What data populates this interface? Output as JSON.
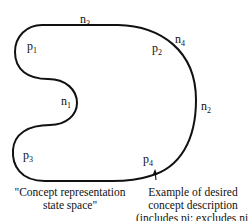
{
  "diagram": {
    "labels": {
      "p1": {
        "base": "p",
        "sub": "1"
      },
      "p2": {
        "base": "p",
        "sub": "2"
      },
      "p3": {
        "base": "p",
        "sub": "3"
      },
      "p4": {
        "base": "p",
        "sub": "4"
      },
      "n1": {
        "base": "n",
        "sub": "1"
      },
      "n2": {
        "base": "n",
        "sub": "2"
      },
      "n3": {
        "base": "n",
        "sub": "3"
      },
      "n4": {
        "base": "n",
        "sub": "4"
      }
    },
    "captions": {
      "left_line1": "\"Concept  representation",
      "left_line2": "state space\"",
      "right_line1": "Example of desired",
      "right_line2": "concept  description",
      "right_line3": "(includes pi; excludes ni)"
    },
    "colors": {
      "stroke": "#111111",
      "background": "#ffffff"
    }
  }
}
